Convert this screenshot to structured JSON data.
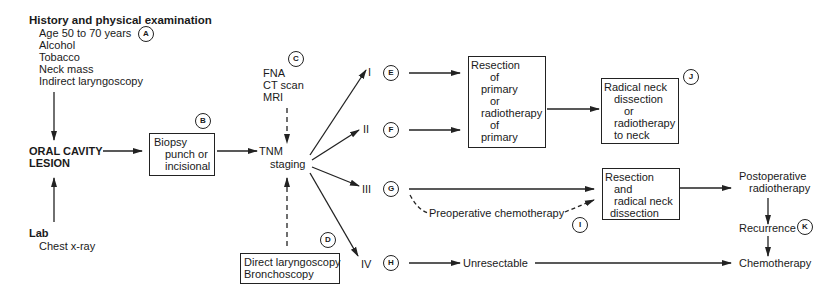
{
  "history": {
    "title": "History and physical examination",
    "items": [
      "Age 50 to 70 years",
      "Alcohol",
      "Tobacco",
      "Neck mass",
      "Indirect laryngoscopy"
    ],
    "marker": "A"
  },
  "lesion": {
    "line1": "ORAL CAVITY",
    "line2": "LESION"
  },
  "lab": {
    "title": "Lab",
    "items": [
      "Chest x-ray"
    ]
  },
  "biopsy": {
    "lines": [
      "Biopsy",
      "punch or",
      "incisional"
    ],
    "marker": "B"
  },
  "imaging": {
    "items": [
      "FNA",
      "CT scan",
      "MRI"
    ],
    "marker": "C"
  },
  "staging": {
    "line1": "TNM",
    "line2": "staging"
  },
  "endoscopy": {
    "lines": [
      "Direct laryngoscopy",
      "Bronchoscopy"
    ],
    "marker": "D"
  },
  "stages": [
    {
      "label": "I",
      "marker": "E"
    },
    {
      "label": "II",
      "marker": "F"
    },
    {
      "label": "III",
      "marker": "G"
    },
    {
      "label": "IV",
      "marker": "H"
    }
  ],
  "resection_primary": {
    "lines": [
      "Resection",
      "of",
      "primary",
      "or",
      "radiotherapy",
      "of",
      "primary"
    ]
  },
  "neck_treatment": {
    "lines": [
      "Radical neck",
      "dissection",
      "or",
      "radiotherapy",
      "to neck"
    ],
    "marker": "J"
  },
  "preop_chemo": {
    "label": "Preoperative chemotherapy",
    "marker": "I"
  },
  "resection_neck": {
    "lines": [
      "Resection",
      "and",
      "radical neck",
      "dissection"
    ]
  },
  "postop": {
    "line1": "Postoperative",
    "line2": "radiotherapy"
  },
  "recurrence": {
    "label": "Recurrence",
    "marker": "K"
  },
  "unresectable": {
    "label": "Unresectable"
  },
  "chemotherapy": {
    "label": "Chemotherapy"
  }
}
